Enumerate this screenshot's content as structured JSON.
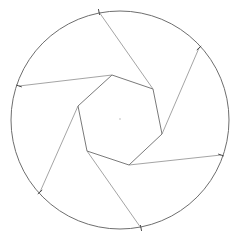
{
  "canvas": {
    "width": 232,
    "height": 244,
    "background": "#ffffff"
  },
  "colors": {
    "circle": "#6e6e6e",
    "polygon": "#7a7a7a",
    "rays": "#9a9a9a",
    "ticks": "#4a4a4a",
    "center": "#aaaaaa"
  },
  "circle": {
    "cx": 120,
    "cy": 120,
    "r": 109
  },
  "center_point": {
    "x": 120,
    "y": 119
  },
  "polygon": {
    "sides": 6,
    "vertices": [
      [
        112,
        75
      ],
      [
        153,
        89
      ],
      [
        162,
        134
      ],
      [
        129,
        165
      ],
      [
        87,
        151
      ],
      [
        78,
        106
      ]
    ]
  },
  "rays": [
    {
      "from": [
        112,
        75
      ],
      "to": [
        19,
        86
      ]
    },
    {
      "from": [
        153,
        89
      ],
      "to": [
        99,
        12
      ]
    },
    {
      "from": [
        162,
        134
      ],
      "to": [
        199,
        48
      ]
    },
    {
      "from": [
        129,
        165
      ],
      "to": [
        221,
        155
      ]
    },
    {
      "from": [
        87,
        151
      ],
      "to": [
        141,
        228
      ]
    },
    {
      "from": [
        78,
        106
      ],
      "to": [
        40,
        192
      ]
    }
  ]
}
